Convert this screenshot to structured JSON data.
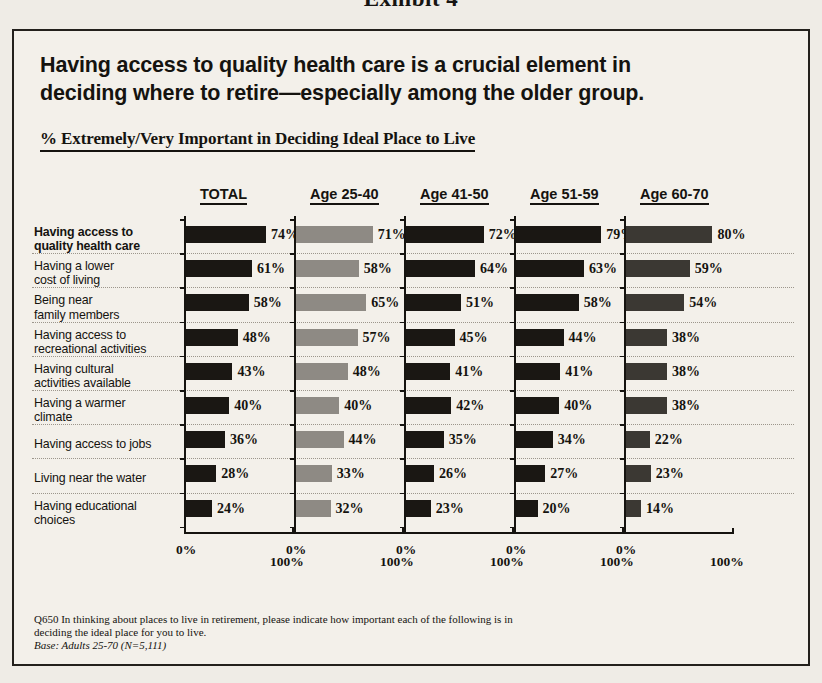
{
  "exhibit": {
    "caption": "Exhibit 4"
  },
  "headline": {
    "line1": "Having access to quality health care is a crucial element in",
    "line2": "deciding where to retire—especially among the older group."
  },
  "subtitle": "% Extremely/Very Important in Deciding Ideal Place to Live",
  "axis": {
    "min_label": "0%",
    "max_label": "100%"
  },
  "footnote": {
    "question_line1": "Q650 In thinking about places to live in retirement, please indicate how important each of the following is in",
    "question_line2": "deciding the ideal place for you to live.",
    "base": "Base: Adults 25-70 (N=5,111)"
  },
  "colors": {
    "bar_dark": "#1a1713",
    "bar_gray": "#8e8a84",
    "bar_dark_gray": "#3b3833",
    "frame": "#23201c",
    "paper": "#f3f0ea",
    "page": "#efece6"
  },
  "chart_data": {
    "type": "bar",
    "title": "Having access to quality health care is a crucial element in deciding where to retire—especially among the older group.",
    "subtitle": "% Extremely/Very Important in Deciding Ideal Place to Live",
    "xlabel": "",
    "ylabel": "",
    "xlim": [
      0,
      100
    ],
    "grid": true,
    "orientation": "horizontal",
    "legend": "none",
    "unit": "%",
    "categories": [
      "Having access to quality health care",
      "Having a lower cost of living",
      "Being near family members",
      "Having access to recreational activities",
      "Having cultural activities available",
      "Having a warmer climate",
      "Having access to jobs",
      "Living near the water",
      "Having educational choices"
    ],
    "category_lines": [
      [
        "Having access to",
        "quality health care"
      ],
      [
        "Having a lower",
        "cost of living"
      ],
      [
        "Being near",
        "family members"
      ],
      [
        "Having access to",
        "recreational activities"
      ],
      [
        "Having cultural",
        "activities available"
      ],
      [
        "Having a warmer",
        "climate"
      ],
      [
        "Having access to jobs"
      ],
      [
        "Living near the water"
      ],
      [
        "Having educational",
        "choices"
      ]
    ],
    "category_bold": [
      true,
      false,
      false,
      false,
      false,
      false,
      false,
      false,
      false
    ],
    "series": [
      {
        "name": "TOTAL",
        "color": "#1a1713",
        "values": [
          74,
          61,
          58,
          48,
          43,
          40,
          36,
          28,
          24
        ],
        "labels": [
          "74%",
          "61%",
          "58%",
          "48%",
          "43%",
          "40%",
          "36%",
          "28%",
          "24%"
        ]
      },
      {
        "name": "Age 25-40",
        "color": "#8e8a84",
        "values": [
          71,
          58,
          65,
          57,
          48,
          40,
          44,
          33,
          32
        ],
        "labels": [
          "71%",
          "58%",
          "65%",
          "57%",
          "48%",
          "40%",
          "44%",
          "33%",
          "32%"
        ]
      },
      {
        "name": "Age 41-50",
        "color": "#1a1713",
        "values": [
          72,
          64,
          51,
          45,
          41,
          42,
          35,
          26,
          23
        ],
        "labels": [
          "72%",
          "64%",
          "51%",
          "45%",
          "41%",
          "42%",
          "35%",
          "26%",
          "23%"
        ]
      },
      {
        "name": "Age 51-59",
        "color": "#1a1713",
        "values": [
          79,
          63,
          58,
          44,
          41,
          40,
          34,
          27,
          20
        ],
        "labels": [
          "79%",
          "63%",
          "58%",
          "44%",
          "41%",
          "40%",
          "34%",
          "27%",
          "20%"
        ]
      },
      {
        "name": "Age 60-70",
        "color": "#3b3833",
        "values": [
          80,
          59,
          54,
          38,
          38,
          38,
          22,
          23,
          14
        ],
        "labels": [
          "80%",
          "59%",
          "54%",
          "38%",
          "38%",
          "38%",
          "22%",
          "23%",
          "14%"
        ]
      }
    ]
  }
}
